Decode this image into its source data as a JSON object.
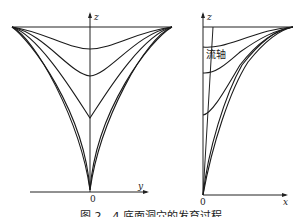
{
  "figure": {
    "left_panel": {
      "vertical_axis_label": "z",
      "horizontal_axis_label": "y",
      "origin_label": "0"
    },
    "right_panel": {
      "vertical_axis_label": "z",
      "horizontal_axis_label": "x",
      "origin_label": "0",
      "annotation": "流轴"
    },
    "caption": "图 2 - 4   底面洞穴的发育过程"
  }
}
